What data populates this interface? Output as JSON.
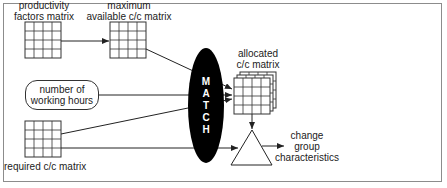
{
  "diagram": {
    "nodes": {
      "productivity_matrix": {
        "label_line1": "productivity",
        "label_line2": "factors matrix"
      },
      "max_available_matrix": {
        "label_line1": "maximum",
        "label_line2": "available c/c matrix"
      },
      "working_hours": {
        "label_line1": "number of",
        "label_line2": "working hours"
      },
      "required_matrix": {
        "label": "required c/c matrix"
      },
      "match": {
        "letters": [
          "M",
          "A",
          "T",
          "C",
          "H"
        ]
      },
      "allocated_matrix": {
        "label_line1": "allocated",
        "label_line2": "c/c matrix"
      },
      "output": {
        "label_line1": "change",
        "label_line2": "group",
        "label_line3": "characteristics"
      }
    },
    "edges": [
      {
        "from": "productivity_matrix",
        "to": "max_available_matrix"
      },
      {
        "from": "max_available_matrix",
        "to": "allocated_matrix"
      },
      {
        "from": "working_hours",
        "to": "allocated_matrix"
      },
      {
        "from": "required_matrix",
        "to": "allocated_matrix"
      },
      {
        "from": "required_matrix",
        "to": "comparator"
      },
      {
        "from": "allocated_matrix",
        "to": "comparator"
      },
      {
        "from": "comparator",
        "to": "output"
      }
    ],
    "colors": {
      "line": "#222222",
      "match_fill": "#000000",
      "frame": "#8c8c8c"
    }
  }
}
